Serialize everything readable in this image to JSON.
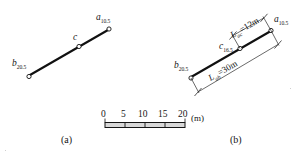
{
  "figure": {
    "caption_a": "(a)",
    "caption_b": "(b)",
    "panel_a": {
      "point_a": {
        "name": "a",
        "subscript": "10.5"
      },
      "point_b": {
        "name": "b",
        "subscript": "20.5"
      },
      "point_c": {
        "name": "c",
        "subscript": ""
      }
    },
    "panel_b": {
      "point_a": {
        "name": "a",
        "subscript": "10.5"
      },
      "point_b": {
        "name": "b",
        "subscript": "20.5"
      },
      "point_c": {
        "name": "c",
        "subscript": "16.5"
      },
      "dim_ac": {
        "var": "L",
        "var_sub": "ac",
        "eq": "=",
        "value": "12m"
      },
      "dim_ab": {
        "var": "L",
        "var_sub": "ab",
        "eq": "=",
        "value": "30m"
      }
    },
    "scale_bar": {
      "ticks": [
        "0",
        "5",
        "10",
        "15",
        "20"
      ],
      "unit": "(m)"
    },
    "colors": {
      "ink": "#151515",
      "line": "#111111",
      "paper": "#ffffff",
      "thin": "#2a2a2a"
    }
  }
}
